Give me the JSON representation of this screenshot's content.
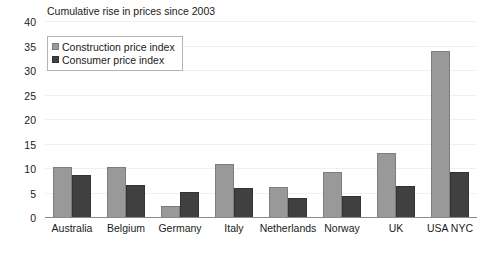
{
  "chart_data": {
    "type": "bar",
    "title": "Cumulative rise in prices since 2003",
    "xlabel": "",
    "ylabel": "",
    "ylim": [
      0,
      40
    ],
    "yticks": [
      0,
      5,
      10,
      15,
      20,
      25,
      30,
      35,
      40
    ],
    "grid": true,
    "legend_position": "top-left",
    "categories": [
      "Australia",
      "Belgium",
      "Germany",
      "Italy",
      "Netherlands",
      "Norway",
      "UK",
      "USA NYC"
    ],
    "series": [
      {
        "name": "Construction price index",
        "color": "#999999",
        "values": [
          10.4,
          10.4,
          2.4,
          11.1,
          6.3,
          9.3,
          13.3,
          34.0
        ]
      },
      {
        "name": "Consumer price index",
        "color": "#404040",
        "values": [
          8.8,
          6.8,
          5.4,
          6.2,
          4.1,
          4.4,
          6.6,
          9.4
        ]
      }
    ]
  }
}
